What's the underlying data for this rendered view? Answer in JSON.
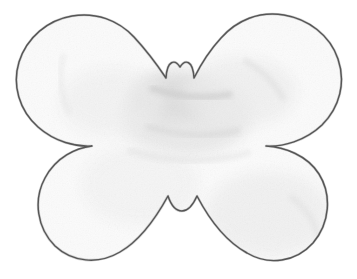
{
  "image": {
    "kind": "scanned-pencil-drawing",
    "subject": "butterfly-silhouette",
    "alt_text": "Hand-drawn pencil outline of a butterfly silhouette with four rounded wings, a small rounded head bump at top center and a small notched tail at bottom center, filled with pale gray paper texture on a white background.",
    "width_px": 357,
    "height_px": 279,
    "orientation": "landscape",
    "caption": ""
  },
  "colors": {
    "background": "#ffffff",
    "outline": "#5a5a5a",
    "outline_soft": "#8d8d8d",
    "fill_base": "#fbfbfb",
    "fill_shadow": "#ececec",
    "fill_shadow_deep": "#e1e1e1",
    "texture_speckle": "#d8d8d8"
  },
  "geometry": {
    "note": "Key traced landmark points of the butterfly outline, in image pixel coordinates.",
    "head_bump": {
      "peak_x": 180,
      "peak_y": 67,
      "left_valley_x": 166,
      "left_valley_y": 78,
      "right_valley_x": 194,
      "right_valley_y": 78
    },
    "tail_notch": {
      "left_peak_x": 168,
      "left_peak_y": 196,
      "dip_x": 182,
      "dip_y": 211,
      "right_peak_x": 197,
      "right_peak_y": 196
    },
    "waist_left": {
      "x": 92,
      "y": 146
    },
    "waist_right": {
      "x": 266,
      "y": 146
    },
    "upper_left_wing": {
      "top_x": 120,
      "top_y": 16,
      "outer_x": 18,
      "outer_y": 72
    },
    "upper_right_wing": {
      "top_x": 246,
      "top_y": 16,
      "outer_x": 345,
      "outer_y": 70
    },
    "lower_left_wing": {
      "outer_x": 46,
      "outer_y": 214,
      "bottom_x": 92,
      "bottom_y": 259
    },
    "lower_right_wing": {
      "outer_x": 322,
      "outer_y": 220,
      "bottom_x": 268,
      "bottom_y": 262
    }
  },
  "labels": {
    "figure_title": "",
    "figure_number": "",
    "credit": ""
  }
}
